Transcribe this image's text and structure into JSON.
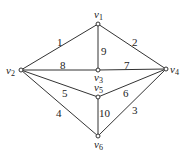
{
  "graph": {
    "nodes": [
      {
        "id": "v1",
        "name": "v",
        "sub": "1",
        "x": 98,
        "y": 24
      },
      {
        "id": "v2",
        "name": "v",
        "sub": "2",
        "x": 21,
        "y": 70
      },
      {
        "id": "v3",
        "name": "v",
        "sub": "3",
        "x": 98,
        "y": 70
      },
      {
        "id": "v4",
        "name": "v",
        "sub": "4",
        "x": 166,
        "y": 69
      },
      {
        "id": "v5",
        "name": "v",
        "sub": "5",
        "x": 98,
        "y": 97
      },
      {
        "id": "v6",
        "name": "v",
        "sub": "6",
        "x": 98,
        "y": 136
      }
    ],
    "edges": [
      {
        "from": "v2",
        "to": "v1",
        "label": "1"
      },
      {
        "from": "v1",
        "to": "v4",
        "label": "2"
      },
      {
        "from": "v4",
        "to": "v6",
        "label": "3"
      },
      {
        "from": "v2",
        "to": "v6",
        "label": "4"
      },
      {
        "from": "v2",
        "to": "v5",
        "label": "5"
      },
      {
        "from": "v5",
        "to": "v4",
        "label": "6"
      },
      {
        "from": "v3",
        "to": "v4",
        "label": "7"
      },
      {
        "from": "v2",
        "to": "v3",
        "label": "8"
      },
      {
        "from": "v1",
        "to": "v3",
        "label": "9"
      },
      {
        "from": "v5",
        "to": "v6",
        "label": "10"
      }
    ]
  }
}
